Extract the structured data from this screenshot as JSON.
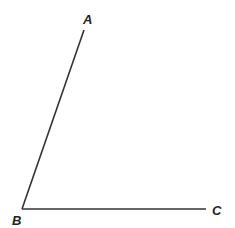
{
  "diagram": {
    "type": "angle",
    "stroke_color": "#333333",
    "points": {
      "A": {
        "label": "A",
        "x": 84,
        "y": 30,
        "label_x": 83,
        "label_y": 24
      },
      "B": {
        "label": "B",
        "x": 22,
        "y": 209,
        "label_x": 12,
        "label_y": 225
      },
      "C": {
        "label": "C",
        "x": 206,
        "y": 209,
        "label_x": 212,
        "label_y": 215
      }
    },
    "segments": [
      {
        "from": "B",
        "to": "A"
      },
      {
        "from": "B",
        "to": "C"
      }
    ]
  }
}
